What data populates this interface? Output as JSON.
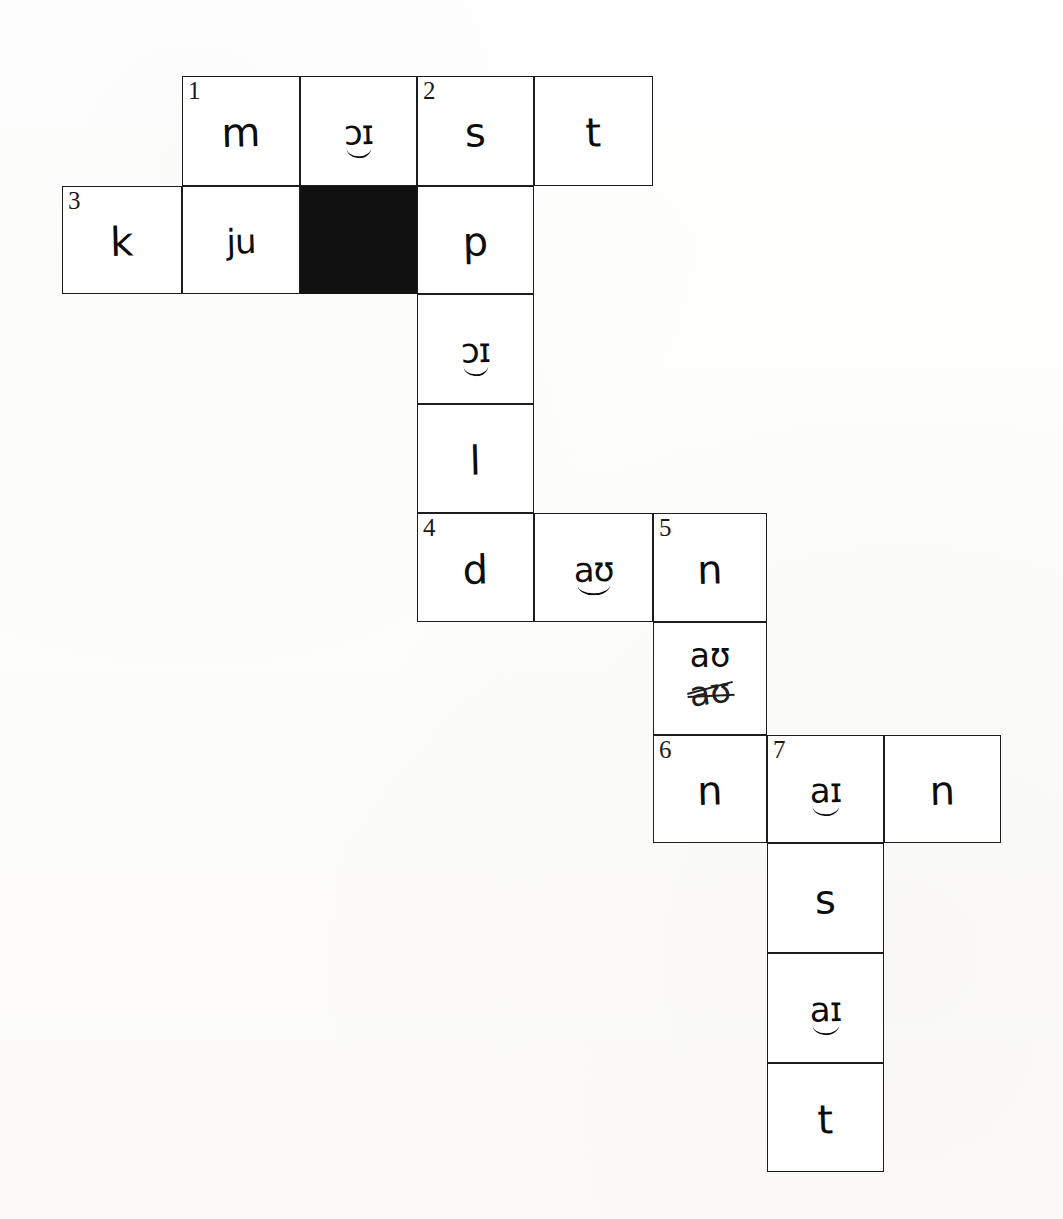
{
  "document": {
    "kind": "handwritten-phonetic-crossword",
    "background_color": "#fdfdfc",
    "grid_line_color": "#1d1d1d",
    "blocked_cell_color": "#111111",
    "ink_color": "#0d0d0d"
  },
  "grid": {
    "columns_x": [
      62,
      182,
      300,
      417,
      534,
      653,
      767,
      884,
      1001
    ],
    "rows_y": [
      76,
      186,
      294,
      404,
      513,
      622,
      735,
      843,
      953,
      1063,
      1172
    ],
    "cell_width": 118,
    "cell_height": 109
  },
  "cells": [
    {
      "id": "c1",
      "col": 1,
      "row": 0,
      "number": "1",
      "letter": "m",
      "blocked": false,
      "style": "plain",
      "strike": ""
    },
    {
      "id": "c2",
      "col": 2,
      "row": 0,
      "number": "",
      "letter": "ɔɪ",
      "blocked": false,
      "style": "tie",
      "strike": ""
    },
    {
      "id": "c3",
      "col": 3,
      "row": 0,
      "number": "2",
      "letter": "s",
      "blocked": false,
      "style": "plain",
      "strike": ""
    },
    {
      "id": "c4",
      "col": 4,
      "row": 0,
      "number": "",
      "letter": "t",
      "blocked": false,
      "style": "plain",
      "strike": ""
    },
    {
      "id": "c5",
      "col": 0,
      "row": 1,
      "number": "3",
      "letter": "k",
      "blocked": false,
      "style": "plain",
      "strike": ""
    },
    {
      "id": "c6",
      "col": 1,
      "row": 1,
      "number": "",
      "letter": "ju",
      "blocked": false,
      "style": "plain",
      "strike": ""
    },
    {
      "id": "c7",
      "col": 2,
      "row": 1,
      "number": "",
      "letter": "",
      "blocked": true,
      "style": "plain",
      "strike": ""
    },
    {
      "id": "c8",
      "col": 3,
      "row": 1,
      "number": "",
      "letter": "p",
      "blocked": false,
      "style": "plain",
      "strike": ""
    },
    {
      "id": "c9",
      "col": 3,
      "row": 2,
      "number": "",
      "letter": "ɔɪ",
      "blocked": false,
      "style": "tie",
      "strike": ""
    },
    {
      "id": "c10",
      "col": 3,
      "row": 3,
      "number": "",
      "letter": "l",
      "blocked": false,
      "style": "plain",
      "strike": ""
    },
    {
      "id": "c11",
      "col": 3,
      "row": 4,
      "number": "4",
      "letter": "d",
      "blocked": false,
      "style": "plain",
      "strike": ""
    },
    {
      "id": "c12",
      "col": 4,
      "row": 4,
      "number": "",
      "letter": "aʊ",
      "blocked": false,
      "style": "tie",
      "strike": ""
    },
    {
      "id": "c13",
      "col": 5,
      "row": 4,
      "number": "5",
      "letter": "n",
      "blocked": false,
      "style": "plain",
      "strike": ""
    },
    {
      "id": "c14",
      "col": 5,
      "row": 5,
      "number": "",
      "letter": "aʊ",
      "blocked": false,
      "style": "stacked",
      "strike": "aʊ"
    },
    {
      "id": "c15",
      "col": 5,
      "row": 6,
      "number": "6",
      "letter": "n",
      "blocked": false,
      "style": "plain",
      "strike": ""
    },
    {
      "id": "c16",
      "col": 6,
      "row": 6,
      "number": "7",
      "letter": "aɪ",
      "blocked": false,
      "style": "tie",
      "strike": ""
    },
    {
      "id": "c17",
      "col": 7,
      "row": 6,
      "number": "",
      "letter": "n",
      "blocked": false,
      "style": "plain",
      "strike": ""
    },
    {
      "id": "c18",
      "col": 6,
      "row": 7,
      "number": "",
      "letter": "s",
      "blocked": false,
      "style": "plain",
      "strike": ""
    },
    {
      "id": "c19",
      "col": 6,
      "row": 8,
      "number": "",
      "letter": "aɪ",
      "blocked": false,
      "style": "tie",
      "strike": ""
    },
    {
      "id": "c20",
      "col": 6,
      "row": 9,
      "number": "",
      "letter": "t",
      "blocked": false,
      "style": "plain",
      "strike": ""
    }
  ],
  "clue_numbers": [
    "1",
    "2",
    "3",
    "4",
    "5",
    "6",
    "7"
  ]
}
